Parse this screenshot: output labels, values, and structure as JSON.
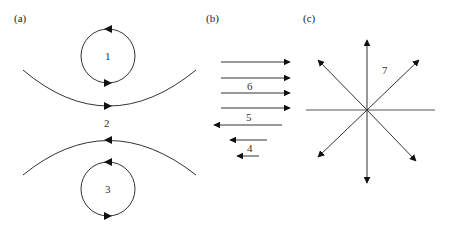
{
  "panels": {
    "a": {
      "label": "(a)",
      "regions": [
        "1",
        "2",
        "3"
      ],
      "description": "Two opposing curved flow lines with a counter-rotating circulation above and below"
    },
    "b": {
      "label": "(b)",
      "regions": [
        "6",
        "5",
        "4"
      ],
      "right_arrows": 4,
      "left_arrows": 3
    },
    "c": {
      "label": "(c)",
      "regions": [
        "7"
      ],
      "arrow_directions": [
        "up",
        "up-right",
        "up-left",
        "down-left",
        "down-right",
        "down"
      ]
    }
  },
  "colors": {
    "stroke": "#333333",
    "text": "#222222"
  }
}
